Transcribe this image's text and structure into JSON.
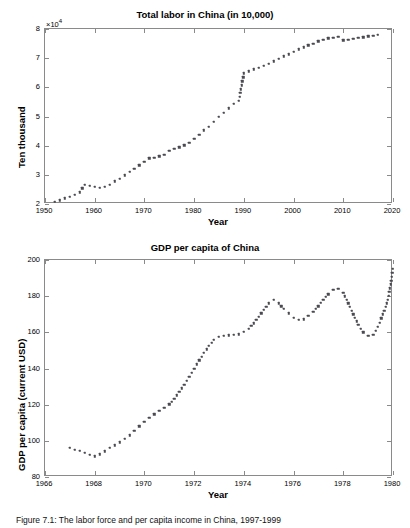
{
  "figure": {
    "caption": "Figure 7.1:  The labor force and per capita income in China, 1997-1999"
  },
  "chart_data": [
    {
      "type": "scatter",
      "id": "total-labor-china",
      "title": "Total labor in China (in 10,000)",
      "xlabel": "Year",
      "ylabel": "Ten thousand",
      "y_exponent": "×10",
      "y_exponent_power": "4",
      "xlim": [
        1950,
        2020
      ],
      "ylim": [
        2,
        8
      ],
      "xticks": [
        1950,
        1960,
        1970,
        1980,
        1990,
        2000,
        2010,
        2020
      ],
      "yticks": [
        2,
        3,
        4,
        5,
        6,
        7,
        8
      ],
      "xtick_labels": [
        "1950",
        "1960",
        "1970",
        "1980",
        "1990",
        "2000",
        "2010",
        "2020"
      ],
      "ytick_labels": [
        "2",
        "3",
        "4",
        "5",
        "6",
        "7",
        "8"
      ],
      "grid": false,
      "legend": "none",
      "marker": "square-dotted",
      "marker_color": "#4a4a50",
      "x": [
        1952,
        1953,
        1954,
        1955,
        1956,
        1957,
        1958,
        1959,
        1960,
        1961,
        1962,
        1963,
        1964,
        1965,
        1966,
        1967,
        1968,
        1969,
        1970,
        1971,
        1972,
        1973,
        1974,
        1975,
        1976,
        1977,
        1978,
        1979,
        1980,
        1981,
        1982,
        1983,
        1984,
        1985,
        1986,
        1987,
        1988,
        1989,
        1990,
        1991,
        1992,
        1993,
        1994,
        1995,
        1996,
        1997,
        1998,
        1999,
        2000,
        2001,
        2002,
        2003,
        2004,
        2005,
        2006,
        2007,
        2008,
        2009,
        2010,
        2011,
        2012,
        2013,
        2014,
        2015,
        2016,
        2017
      ],
      "values": [
        2.072,
        2.132,
        2.194,
        2.257,
        2.323,
        2.405,
        2.661,
        2.617,
        2.588,
        2.559,
        2.591,
        2.666,
        2.774,
        2.868,
        2.981,
        3.094,
        3.212,
        3.321,
        3.442,
        3.562,
        3.586,
        3.637,
        3.691,
        3.819,
        3.882,
        3.939,
        4.015,
        4.105,
        4.236,
        4.372,
        4.528,
        4.646,
        4.816,
        4.987,
        5.128,
        5.278,
        5.433,
        5.533,
        6.475,
        6.547,
        6.615,
        6.68,
        6.744,
        6.805,
        6.895,
        6.982,
        7.064,
        7.139,
        7.209,
        7.3,
        7.374,
        7.44,
        7.5,
        7.583,
        7.64,
        7.68,
        7.705,
        7.728,
        7.61,
        7.64,
        7.67,
        7.69,
        7.72,
        7.75,
        7.77,
        7.8
      ]
    },
    {
      "type": "scatter",
      "id": "gdp-per-capita-china",
      "title": "GDP per capita of China",
      "xlabel": "Year",
      "ylabel": "GDP per capita (current USD)",
      "xlim": [
        1966,
        1980
      ],
      "ylim": [
        80,
        200
      ],
      "xticks": [
        1966,
        1968,
        1970,
        1972,
        1974,
        1976,
        1978,
        1980
      ],
      "yticks": [
        80,
        100,
        120,
        140,
        160,
        180,
        200
      ],
      "xtick_labels": [
        "1966",
        "1968",
        "1970",
        "1972",
        "1974",
        "1976",
        "1978",
        "1980"
      ],
      "ytick_labels": [
        "80",
        "100",
        "120",
        "140",
        "160",
        "180",
        "200"
      ],
      "grid": false,
      "legend": "none",
      "marker": "square-dotted",
      "marker_color": "#4a4a50",
      "x": [
        1967.0,
        1967.2,
        1967.4,
        1967.6,
        1967.8,
        1968.0,
        1968.2,
        1968.4,
        1968.6,
        1968.8,
        1969.0,
        1969.2,
        1969.4,
        1969.6,
        1969.8,
        1970.0,
        1970.2,
        1970.4,
        1970.6,
        1970.8,
        1971.0,
        1971.2,
        1971.4,
        1971.6,
        1971.8,
        1972.0,
        1972.2,
        1972.4,
        1972.6,
        1972.8,
        1973.0,
        1973.2,
        1973.4,
        1973.6,
        1973.8,
        1974.0,
        1974.2,
        1974.4,
        1974.6,
        1974.8,
        1975.0,
        1975.2,
        1975.4,
        1975.6,
        1975.8,
        1976.0,
        1976.2,
        1976.4,
        1976.6,
        1976.8,
        1977.0,
        1977.2,
        1977.4,
        1977.6,
        1977.8,
        1978.0,
        1978.2,
        1978.4,
        1978.6,
        1978.8,
        1979.0,
        1979.2,
        1979.4,
        1979.6,
        1979.8,
        1980.0
      ],
      "values": [
        96.0,
        95.2,
        94.4,
        93.4,
        92.4,
        91.5,
        92.6,
        94.2,
        96.0,
        97.6,
        99.2,
        101.0,
        103.0,
        105.5,
        108.0,
        110.5,
        112.6,
        114.6,
        116.6,
        118.4,
        120.2,
        123.2,
        127.0,
        131.0,
        135.5,
        140.0,
        144.5,
        148.6,
        152.6,
        156.0,
        157.6,
        158.0,
        158.4,
        158.6,
        159.0,
        160.2,
        162.0,
        165.0,
        168.6,
        172.4,
        176.0,
        178.0,
        176.0,
        173.0,
        170.5,
        168.2,
        167.0,
        167.2,
        169.0,
        171.5,
        174.5,
        178.0,
        181.0,
        183.5,
        184.2,
        182.0,
        176.0,
        170.0,
        164.0,
        160.0,
        158.2,
        158.6,
        163.0,
        170.0,
        178.0,
        195.0
      ]
    }
  ]
}
